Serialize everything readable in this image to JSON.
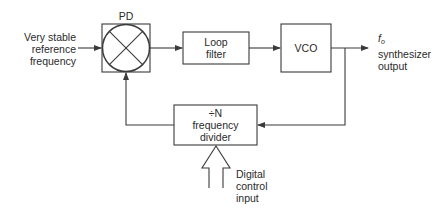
{
  "diagram": {
    "type": "block-diagram",
    "input": {
      "lines": [
        "Very stable",
        "reference",
        "frequency"
      ]
    },
    "blocks": {
      "phase_detector": {
        "label": "PD"
      },
      "loop_filter": {
        "lines": [
          "Loop",
          "filter"
        ]
      },
      "vco": {
        "label": "VCO"
      },
      "divider": {
        "lines": [
          "÷N",
          "frequency",
          "divider"
        ]
      }
    },
    "output": {
      "symbol": "f",
      "subscript": "o",
      "lines": [
        "synthesizer",
        "output"
      ]
    },
    "control": {
      "lines": [
        "Digital",
        "control",
        "input"
      ]
    },
    "colors": {
      "line": "#3a3a3a",
      "background": "#ffffff"
    }
  }
}
